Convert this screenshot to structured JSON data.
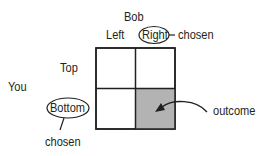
{
  "column_player": {
    "name": "Bob",
    "options": [
      "Left",
      "Right"
    ],
    "chosen_label": "chosen"
  },
  "row_player": {
    "name": "You",
    "options": [
      "Top",
      "Bottom"
    ],
    "chosen_label": "chosen"
  },
  "outcome_label": "outcome",
  "colors": {
    "outcome_fill": "#b3b3b3",
    "line": "#231f20",
    "background": "#ffffff"
  }
}
